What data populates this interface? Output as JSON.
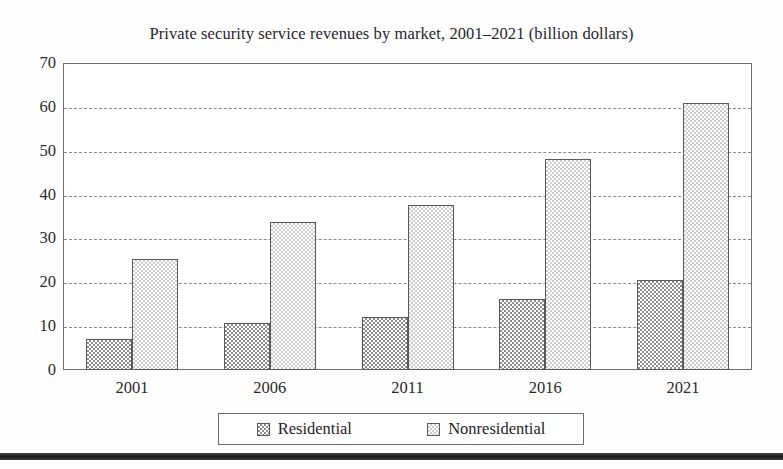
{
  "chart_data": {
    "type": "bar",
    "title": "Private security service revenues by market, 2001–2021 (billion dollars)",
    "xlabel": "",
    "ylabel": "",
    "ylim": [
      0,
      70
    ],
    "ytick_step": 10,
    "yticks": [
      "70",
      "60",
      "50",
      "40",
      "30",
      "20",
      "10",
      "0"
    ],
    "categories": [
      "2001",
      "2006",
      "2011",
      "2016",
      "2021"
    ],
    "series": [
      {
        "name": "Residential",
        "values": [
          7.0,
          10.7,
          12.1,
          16.3,
          20.6
        ],
        "swatch": "dark-checker"
      },
      {
        "name": "Nonresidential",
        "values": [
          25.3,
          33.7,
          37.6,
          48.2,
          60.8
        ],
        "swatch": "light-checker"
      }
    ],
    "grid": true,
    "grid_axis": "y",
    "grid_style": "dashed",
    "legend_position": "bottom",
    "colors": {
      "series_dark": "#8d8d8d",
      "series_light": "#cdcdcd",
      "bar_border": "#5a5a5a",
      "frame": "#6f6f6f",
      "gridline": "#8a8a8a",
      "text": "#2a2a2a",
      "background": "#ffffff"
    }
  },
  "figure": {
    "bottom_rule": ""
  }
}
